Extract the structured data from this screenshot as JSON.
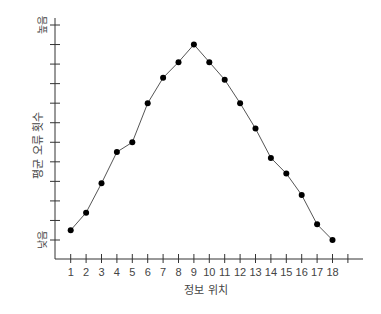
{
  "chart_data": {
    "type": "line",
    "title": "",
    "xlabel": "정보 위치",
    "ylabel": "평균 오류 횟수",
    "y_high_label": "높음",
    "y_low_label": "낮음",
    "categories": [
      "1",
      "2",
      "3",
      "4",
      "5",
      "6",
      "7",
      "8",
      "9",
      "10",
      "11",
      "12",
      "13",
      "14",
      "15",
      "16",
      "17",
      "18"
    ],
    "x": [
      1,
      2,
      3,
      4,
      5,
      6,
      7,
      8,
      9,
      10,
      11,
      12,
      13,
      14,
      15,
      16,
      17,
      18
    ],
    "values": [
      0.5,
      1.4,
      2.9,
      4.5,
      5.0,
      7.0,
      8.3,
      9.1,
      10.0,
      9.1,
      8.2,
      7.0,
      5.7,
      4.2,
      3.4,
      2.3,
      0.8,
      0.0
    ],
    "ylim": [
      0,
      11
    ],
    "y_tick_count": 12,
    "x_extra_tick": 19,
    "grid": false,
    "legend": "none",
    "marker": "filled-circle",
    "colors": {
      "line": "#555555",
      "marker": "#000000",
      "axis": "#333333",
      "text": "#444444"
    }
  }
}
